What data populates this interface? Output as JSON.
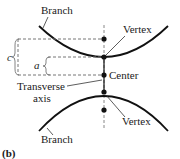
{
  "diagram": {
    "panel_label": "(b)",
    "labels": {
      "branch_top": "Branch",
      "branch_bottom": "Branch",
      "vertex_top": "Vertex",
      "vertex_bottom": "Vertex",
      "center": "Center",
      "transverse_axis_line1": "Transverse",
      "transverse_axis_line2": "axis",
      "c": "c",
      "a": "a"
    },
    "colors": {
      "stroke": "#111111",
      "dashed": "#777777"
    }
  }
}
